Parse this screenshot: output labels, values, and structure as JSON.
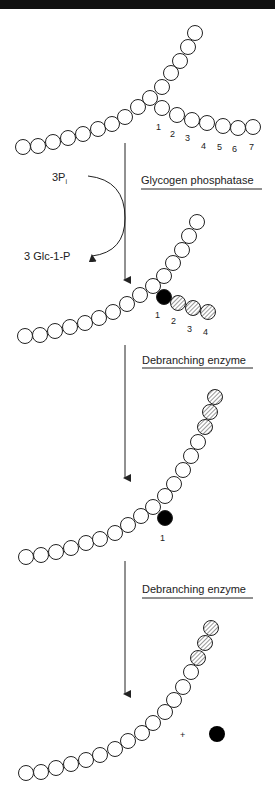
{
  "figure": {
    "enzymes": {
      "step1": "Glycogen phosphatase",
      "step2": "Debranching enzyme",
      "step3": "Debranching enzyme"
    },
    "reactants": {
      "phosphate": "3P",
      "phosphate_subscript": "i",
      "product": "3 Glc-1-P"
    },
    "plus_sign": "+",
    "structure1": {
      "branch_labels": [
        "1",
        "2",
        "3",
        "4",
        "5",
        "6",
        "7"
      ]
    },
    "structure2": {
      "branch_labels": [
        "1",
        "2",
        "3",
        "4"
      ]
    },
    "structure3": {
      "branch_labels": [
        "1"
      ]
    },
    "colors": {
      "line": "#222222",
      "filled_glucose": "#000000",
      "open_glucose": "#ffffff"
    }
  }
}
